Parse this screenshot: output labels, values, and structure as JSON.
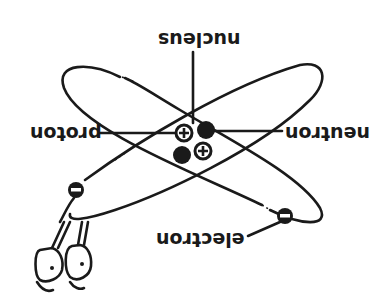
{
  "diagram": {
    "type": "atom-model",
    "orientation": "rotated 180 degrees",
    "labels": {
      "nucleus": "nucleus",
      "proton": "proton",
      "neutron": "neutron",
      "electron": "electron"
    },
    "particles": {
      "nucleus": [
        {
          "kind": "proton",
          "symbol": "+"
        },
        {
          "kind": "neutron",
          "symbol": ""
        },
        {
          "kind": "neutron",
          "symbol": ""
        },
        {
          "kind": "proton",
          "symbol": "+"
        }
      ],
      "electrons": [
        {
          "symbol": "−"
        },
        {
          "symbol": "−"
        }
      ]
    },
    "colors": {
      "ink": "#1a1a1a",
      "background": "#ffffff"
    }
  }
}
